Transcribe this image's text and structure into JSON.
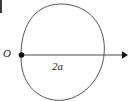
{
  "figure": {
    "background_color": "#ffffff",
    "stroke_color": "#555555",
    "axis_color": "#4a4a4a",
    "marker_color": "#111111",
    "labels": {
      "origin": "O",
      "axis_length": "2a"
    },
    "icons": {
      "origin_point": "origin-dot-icon",
      "axis_arrow": "arrow-right-icon"
    },
    "geometry": {
      "cusp_point": [
        21,
        55
      ],
      "rightmost_point": [
        104,
        55
      ],
      "top_point": [
        60,
        5
      ],
      "bottom_point": [
        60,
        100
      ],
      "axis_start": [
        21,
        55
      ],
      "axis_end": [
        128,
        55
      ],
      "arrow_tip_x": 128,
      "marker_radius": 2.6,
      "curve_total_width": "2a"
    }
  }
}
